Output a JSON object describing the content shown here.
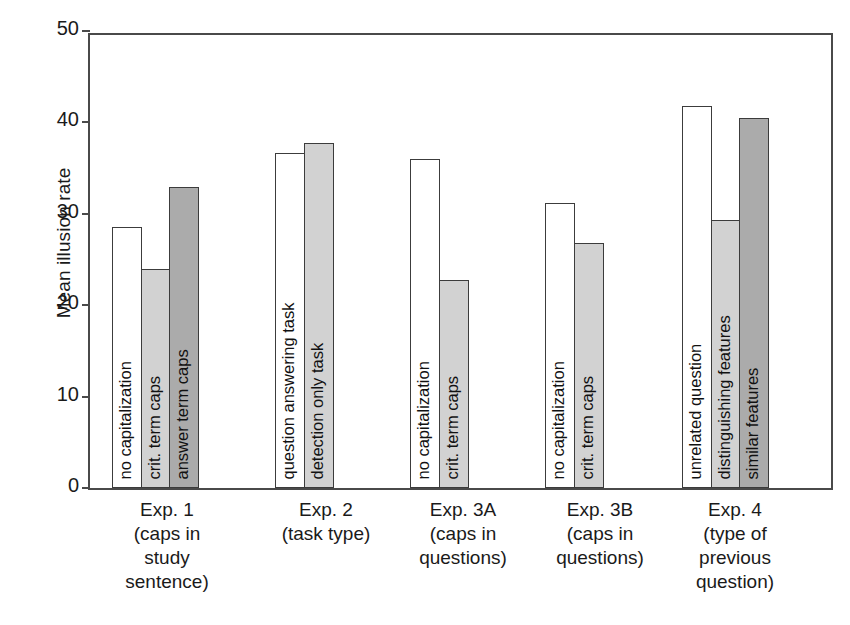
{
  "chart_data": {
    "type": "bar",
    "title": "",
    "subtitle": "",
    "xlabel": "",
    "ylabel": "Mean illusion rate",
    "ylim": [
      0,
      50
    ],
    "yticks": [
      0,
      10,
      20,
      30,
      40,
      50
    ],
    "grid": false,
    "legend": "none (bars labeled in-place)",
    "orientation": "vertical",
    "categories": [
      "Exp. 1 (caps in study sentence)",
      "Exp. 2 (task type)",
      "Exp. 3A (caps in questions)",
      "Exp. 3B (caps in questions)",
      "Exp. 4 (type of previous question)"
    ],
    "groups": [
      {
        "caption_lines": [
          "Exp. 1",
          "(caps in",
          "study",
          "sentence)"
        ],
        "bars": [
          {
            "label": "no capitalization",
            "value": 28.6,
            "fill": "white"
          },
          {
            "label": "crit. term caps",
            "value": 24.0,
            "fill": "light"
          },
          {
            "label": "answer term caps",
            "value": 32.9,
            "fill": "dark"
          }
        ]
      },
      {
        "caption_lines": [
          "Exp. 2",
          "(task type)"
        ],
        "bars": [
          {
            "label": "question answering task",
            "value": 36.7,
            "fill": "white"
          },
          {
            "label": "detection only task",
            "value": 37.8,
            "fill": "light"
          }
        ]
      },
      {
        "caption_lines": [
          "Exp. 3A",
          "(caps in",
          "questions)"
        ],
        "bars": [
          {
            "label": "no capitalization",
            "value": 36.0,
            "fill": "white"
          },
          {
            "label": "crit. term caps",
            "value": 22.8,
            "fill": "light"
          }
        ]
      },
      {
        "caption_lines": [
          "Exp. 3B",
          "(caps in",
          "questions)"
        ],
        "bars": [
          {
            "label": "no capitalization",
            "value": 31.2,
            "fill": "white"
          },
          {
            "label": "crit. term caps",
            "value": 26.8,
            "fill": "light"
          }
        ]
      },
      {
        "caption_lines": [
          "Exp. 4",
          "(type of",
          "previous",
          "question)"
        ],
        "bars": [
          {
            "label": "unrelated question",
            "value": 41.8,
            "fill": "white"
          },
          {
            "label": "distinguishing features",
            "value": 29.3,
            "fill": "light"
          },
          {
            "label": "similar features",
            "value": 40.5,
            "fill": "dark"
          }
        ]
      }
    ],
    "colors": {
      "white_fill": "#ffffff",
      "light_fill": "#d2d2d2",
      "dark_fill": "#ababab",
      "outline": "#3c3c3c",
      "axis": "#4a4a4a",
      "text": "#1a1a1a",
      "background": "#ffffff"
    }
  },
  "layout": {
    "bar_width_px": 30,
    "group_left_px": [
      22,
      185,
      320,
      455,
      592
    ],
    "caption_left_px": [
      4,
      163,
      300,
      437,
      572
    ],
    "caption_width_px": 150
  }
}
